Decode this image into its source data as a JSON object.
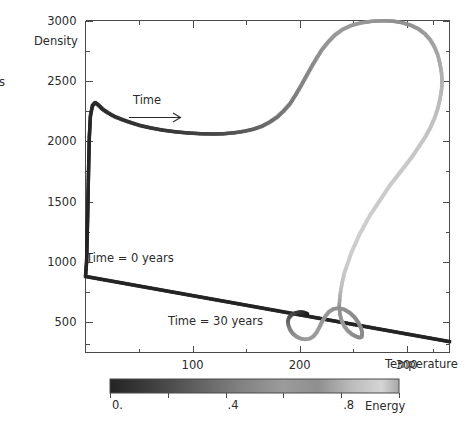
{
  "figure": {
    "background": "#ffffff",
    "ink_color": "#2b2b2b",
    "edge_fragment_glyph": "s"
  },
  "chart_data": {
    "type": "scatter",
    "title": "",
    "subtitle": "",
    "xlabel": "Temperature",
    "ylabel": "Density",
    "xlim": [
      0,
      340
    ],
    "ylim": [
      250,
      3000
    ],
    "grid": false,
    "legend_position": "none",
    "x_ticks_major": [
      100,
      200,
      300
    ],
    "x_ticks_major_labels": [
      "100",
      "200",
      "300"
    ],
    "x_ticks_minor": [
      50,
      150,
      250,
      325
    ],
    "y_ticks_major": [
      3000,
      2500,
      2000,
      1500,
      1000,
      500
    ],
    "y_ticks_major_labels": [
      "3000",
      "2500",
      "2000",
      "1500",
      "1000",
      "500"
    ],
    "y_ticks_minor": [
      2750,
      2250,
      1750,
      1250,
      750,
      320
    ],
    "colormap": "grayscale-dark-to-light",
    "color_variable": "Energy",
    "annotations": [
      {
        "name": "time-arrow-label",
        "text": "Time",
        "x": 115,
        "y": 2230
      },
      {
        "name": "start-label",
        "text": "Time = 0 years",
        "x": 30,
        "y": 960
      },
      {
        "name": "end-label",
        "text": "Time = 30 years",
        "x": 120,
        "y": 420
      }
    ],
    "series": [
      {
        "name": "trajectory",
        "description": "Temperature-density evolution track colored by energy",
        "points": [
          {
            "t": 340,
            "d": 340,
            "e": 0.0
          },
          {
            "t": 0.0,
            "d": 880,
            "e": 0.0
          },
          {
            "t": 1.0,
            "d": 1000,
            "e": 0.0
          },
          {
            "t": 1.5,
            "d": 1180,
            "e": 0.0
          },
          {
            "t": 2.0,
            "d": 1380,
            "e": 0.0
          },
          {
            "t": 2.5,
            "d": 1600,
            "e": 0.01
          },
          {
            "t": 3.0,
            "d": 1820,
            "e": 0.01
          },
          {
            "t": 3.6,
            "d": 2040,
            "e": 0.01
          },
          {
            "t": 4.6,
            "d": 2210,
            "e": 0.02
          },
          {
            "t": 6.5,
            "d": 2295,
            "e": 0.02
          },
          {
            "t": 9.0,
            "d": 2320,
            "e": 0.03
          },
          {
            "t": 12.0,
            "d": 2300,
            "e": 0.03
          },
          {
            "t": 16.0,
            "d": 2265,
            "e": 0.04
          },
          {
            "t": 21.0,
            "d": 2235,
            "e": 0.05
          },
          {
            "t": 27.0,
            "d": 2205,
            "e": 0.06
          },
          {
            "t": 34.0,
            "d": 2180,
            "e": 0.07
          },
          {
            "t": 42.0,
            "d": 2155,
            "e": 0.08
          },
          {
            "t": 51.0,
            "d": 2130,
            "e": 0.09
          },
          {
            "t": 61.0,
            "d": 2110,
            "e": 0.1
          },
          {
            "t": 72.0,
            "d": 2092,
            "e": 0.11
          },
          {
            "t": 84.0,
            "d": 2078,
            "e": 0.12
          },
          {
            "t": 96.0,
            "d": 2068,
            "e": 0.14
          },
          {
            "t": 108.0,
            "d": 2062,
            "e": 0.16
          },
          {
            "t": 119.0,
            "d": 2060,
            "e": 0.18
          },
          {
            "t": 129.0,
            "d": 2062,
            "e": 0.21
          },
          {
            "t": 139.0,
            "d": 2070,
            "e": 0.24
          },
          {
            "t": 148.0,
            "d": 2082,
            "e": 0.27
          },
          {
            "t": 157.0,
            "d": 2100,
            "e": 0.3
          },
          {
            "t": 165.0,
            "d": 2125,
            "e": 0.33
          },
          {
            "t": 172.0,
            "d": 2158,
            "e": 0.36
          },
          {
            "t": 179.0,
            "d": 2200,
            "e": 0.38
          },
          {
            "t": 185.0,
            "d": 2250,
            "e": 0.4
          },
          {
            "t": 191.0,
            "d": 2310,
            "e": 0.42
          },
          {
            "t": 196.0,
            "d": 2380,
            "e": 0.44
          },
          {
            "t": 201.0,
            "d": 2455,
            "e": 0.46
          },
          {
            "t": 206.0,
            "d": 2535,
            "e": 0.48
          },
          {
            "t": 211.0,
            "d": 2615,
            "e": 0.5
          },
          {
            "t": 216.0,
            "d": 2690,
            "e": 0.52
          },
          {
            "t": 221.0,
            "d": 2760,
            "e": 0.54
          },
          {
            "t": 227.0,
            "d": 2825,
            "e": 0.56
          },
          {
            "t": 233.0,
            "d": 2880,
            "e": 0.58
          },
          {
            "t": 240.0,
            "d": 2925,
            "e": 0.6
          },
          {
            "t": 248.0,
            "d": 2958,
            "e": 0.62
          },
          {
            "t": 257.0,
            "d": 2980,
            "e": 0.64
          },
          {
            "t": 267.0,
            "d": 2993,
            "e": 0.66
          },
          {
            "t": 277.0,
            "d": 2998,
            "e": 0.68
          },
          {
            "t": 287.0,
            "d": 2995,
            "e": 0.7
          },
          {
            "t": 296.0,
            "d": 2982,
            "e": 0.72
          },
          {
            "t": 304.0,
            "d": 2960,
            "e": 0.73
          },
          {
            "t": 311.0,
            "d": 2930,
            "e": 0.74
          },
          {
            "t": 317.0,
            "d": 2890,
            "e": 0.75
          },
          {
            "t": 322.0,
            "d": 2840,
            "e": 0.76
          },
          {
            "t": 326.0,
            "d": 2780,
            "e": 0.77
          },
          {
            "t": 329.0,
            "d": 2715,
            "e": 0.78
          },
          {
            "t": 331.0,
            "d": 2645,
            "e": 0.79
          },
          {
            "t": 332.5,
            "d": 2570,
            "e": 0.8
          },
          {
            "t": 333.0,
            "d": 2495,
            "e": 0.81
          },
          {
            "t": 332.5,
            "d": 2420,
            "e": 0.82
          },
          {
            "t": 331.0,
            "d": 2345,
            "e": 0.83
          },
          {
            "t": 329.0,
            "d": 2270,
            "e": 0.84
          },
          {
            "t": 326.0,
            "d": 2190,
            "e": 0.85
          },
          {
            "t": 322.0,
            "d": 2110,
            "e": 0.86
          },
          {
            "t": 317.0,
            "d": 2030,
            "e": 0.87
          },
          {
            "t": 311.0,
            "d": 1950,
            "e": 0.88
          },
          {
            "t": 305.0,
            "d": 1870,
            "e": 0.88
          },
          {
            "t": 298.0,
            "d": 1790,
            "e": 0.89
          },
          {
            "t": 291.0,
            "d": 1710,
            "e": 0.89
          },
          {
            "t": 284.0,
            "d": 1630,
            "e": 0.9
          },
          {
            "t": 278.0,
            "d": 1550,
            "e": 0.9
          },
          {
            "t": 272.0,
            "d": 1470,
            "e": 0.9
          },
          {
            "t": 266.0,
            "d": 1390,
            "e": 0.91
          },
          {
            "t": 261.0,
            "d": 1310,
            "e": 0.91
          },
          {
            "t": 256.0,
            "d": 1230,
            "e": 0.91
          },
          {
            "t": 252.0,
            "d": 1150,
            "e": 0.91
          },
          {
            "t": 248.0,
            "d": 1070,
            "e": 0.91
          },
          {
            "t": 245.0,
            "d": 990,
            "e": 0.9
          },
          {
            "t": 242.0,
            "d": 915,
            "e": 0.89
          },
          {
            "t": 240.0,
            "d": 840,
            "e": 0.87
          },
          {
            "t": 238.5,
            "d": 770,
            "e": 0.84
          },
          {
            "t": 237.5,
            "d": 700,
            "e": 0.8
          },
          {
            "t": 237.0,
            "d": 635,
            "e": 0.75
          },
          {
            "t": 237.5,
            "d": 575,
            "e": 0.7
          },
          {
            "t": 239.0,
            "d": 520,
            "e": 0.65
          },
          {
            "t": 241.5,
            "d": 470,
            "e": 0.6
          },
          {
            "t": 245.0,
            "d": 430,
            "e": 0.56
          },
          {
            "t": 249.0,
            "d": 400,
            "e": 0.53
          },
          {
            "t": 253.0,
            "d": 382,
            "e": 0.51
          },
          {
            "t": 256.0,
            "d": 372,
            "e": 0.5
          },
          {
            "t": 258.0,
            "d": 380,
            "e": 0.5
          },
          {
            "t": 258.5,
            "d": 410,
            "e": 0.5
          },
          {
            "t": 257.5,
            "d": 450,
            "e": 0.5
          },
          {
            "t": 255.0,
            "d": 495,
            "e": 0.5
          },
          {
            "t": 251.5,
            "d": 540,
            "e": 0.51
          },
          {
            "t": 247.0,
            "d": 578,
            "e": 0.52
          },
          {
            "t": 242.0,
            "d": 605,
            "e": 0.53
          },
          {
            "t": 237.0,
            "d": 618,
            "e": 0.54
          },
          {
            "t": 232.0,
            "d": 612,
            "e": 0.55
          },
          {
            "t": 227.5,
            "d": 588,
            "e": 0.56
          },
          {
            "t": 224.0,
            "d": 550,
            "e": 0.57
          },
          {
            "t": 221.0,
            "d": 505,
            "e": 0.58
          },
          {
            "t": 218.5,
            "d": 460,
            "e": 0.59
          },
          {
            "t": 216.0,
            "d": 418,
            "e": 0.6
          },
          {
            "t": 213.0,
            "d": 385,
            "e": 0.61
          },
          {
            "t": 209.5,
            "d": 365,
            "e": 0.61
          },
          {
            "t": 205.5,
            "d": 358,
            "e": 0.6
          },
          {
            "t": 201.0,
            "d": 365,
            "e": 0.58
          },
          {
            "t": 197.0,
            "d": 382,
            "e": 0.55
          },
          {
            "t": 193.5,
            "d": 408,
            "e": 0.51
          },
          {
            "t": 191.0,
            "d": 440,
            "e": 0.46
          },
          {
            "t": 189.5,
            "d": 475,
            "e": 0.4
          },
          {
            "t": 189.0,
            "d": 508,
            "e": 0.34
          },
          {
            "t": 190.0,
            "d": 538,
            "e": 0.27
          },
          {
            "t": 192.5,
            "d": 562,
            "e": 0.21
          },
          {
            "t": 196.0,
            "d": 578,
            "e": 0.15
          },
          {
            "t": 200.0,
            "d": 585,
            "e": 0.09
          },
          {
            "t": 203.5,
            "d": 583,
            "e": 0.04
          },
          {
            "t": 206.0,
            "d": 575,
            "e": 0.01
          },
          {
            "t": 207.0,
            "d": 565,
            "e": 0.0
          }
        ]
      }
    ],
    "colorbar": {
      "name": "energy-colorbar",
      "label": "Energy",
      "min": 0.0,
      "max": 1.0,
      "tick_labels": [
        "0.",
        ".4",
        ".8"
      ],
      "tick_values": [
        0.0,
        0.4,
        0.8
      ],
      "minor_tick_values": [
        0.2,
        0.6,
        1.0
      ],
      "gradient_start": "#2a2a2a",
      "gradient_end": "#d8d8d8"
    }
  }
}
